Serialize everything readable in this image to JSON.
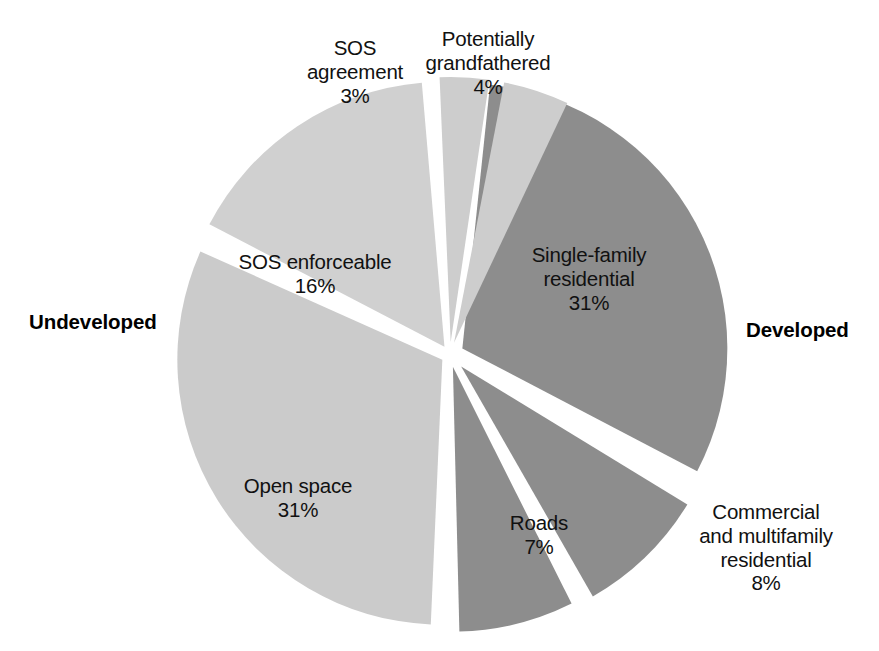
{
  "chart_data": {
    "type": "pie",
    "title": "",
    "legend_position": "none",
    "grid": false,
    "units": "percent",
    "center": [
      450,
      355
    ],
    "radius": 265,
    "groups": [
      {
        "key": "undeveloped",
        "label": "Undeveloped",
        "total": 54
      },
      {
        "key": "developed",
        "label": "Developed",
        "total": 46
      }
    ],
    "categories": [
      "Single-family residential",
      "Commercial and multifamily residential",
      "Roads",
      "Open space",
      "SOS enforceable",
      "SOS agreement",
      "Potentially grandfathered"
    ],
    "values": [
      31,
      8,
      7,
      31,
      16,
      3,
      4
    ],
    "slices": [
      {
        "name": "single-family-residential",
        "label": "Single-family\nresidential\n31%",
        "label_text": "Single-family residential",
        "value": 31,
        "value_label": "31%",
        "group": "developed",
        "color": "#8d8d8d",
        "start_angle": 6,
        "end_angle": 117.6,
        "explode": 14,
        "label_color": "#111111"
      },
      {
        "name": "commercial-and-multifamily-residential",
        "label": "Commercial\nand multifamily\nresidential\n8%",
        "label_text": "Commercial and multifamily residential",
        "value": 8,
        "value_label": "8%",
        "group": "developed",
        "color": "#8d8d8d",
        "start_angle": 121.4,
        "end_angle": 150.2,
        "explode": 16,
        "label_color": "#111111"
      },
      {
        "name": "roads",
        "label": "Roads\n7%",
        "label_text": "Roads",
        "value": 7,
        "value_label": "7%",
        "group": "developed",
        "color": "#8d8d8d",
        "start_angle": 153.4,
        "end_angle": 178.6,
        "explode": 12,
        "label_color": "#111111"
      },
      {
        "name": "open-space",
        "label": "Open space\n31%",
        "label_text": "Open space",
        "value": 31,
        "value_label": "31%",
        "group": "undeveloped",
        "color": "#cbcbcb",
        "start_angle": 182.5,
        "end_angle": 294.1,
        "explode": 9,
        "label_color": "#111111"
      },
      {
        "name": "sos-enforceable",
        "label": "SOS enforceable\n16%",
        "label_text": "SOS enforceable",
        "value": 16,
        "value_label": "16%",
        "group": "undeveloped",
        "color": "#d0d0d0",
        "start_angle": 297.5,
        "end_angle": 355.1,
        "explode": 10,
        "label_color": "#111111"
      },
      {
        "name": "sos-agreement",
        "label": "SOS\nagreement\n3%",
        "label_text": "SOS agreement",
        "value": 3,
        "value_label": "3%",
        "group": "undeveloped",
        "color": "#cdcdcd",
        "start_angle": 357.6,
        "end_angle": 368.4,
        "explode": 13,
        "label_color": "#111111"
      },
      {
        "name": "potentially-grandfathered",
        "label": "Potentially\ngrandfathered\n4%",
        "label_text": "Potentially grandfathered",
        "value": 4,
        "value_label": "4%",
        "group": "undeveloped",
        "color": "#cdcdcd",
        "start_angle": 370.9,
        "end_angle": 385.3,
        "explode": 13,
        "label_color": "#111111"
      }
    ],
    "colors": {
      "developed_slice": "#8d8d8d",
      "undeveloped_slice": "#cbcbcb",
      "background": "#ffffff",
      "text": "#111111"
    }
  },
  "labels": {
    "sos_agreement": "SOS\nagreement\n3%",
    "potentially_grandfathered": "Potentially\ngrandfathered\n4%",
    "sos_enforceable": "SOS enforceable\n16%",
    "open_space": "Open space\n31%",
    "single_family": "Single-family\nresidential\n31%",
    "roads": "Roads\n7%",
    "commercial": "Commercial\nand multifamily\nresidential\n8%",
    "undeveloped": "Undeveloped",
    "developed": "Developed"
  }
}
